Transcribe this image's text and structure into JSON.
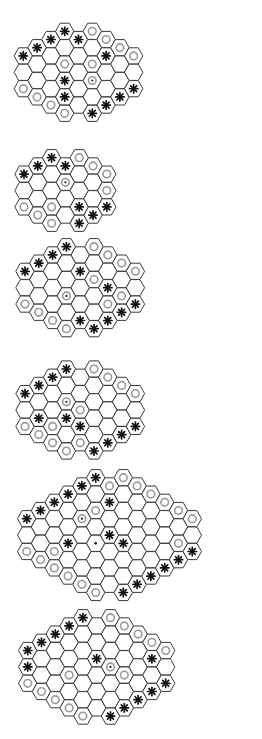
{
  "figure": {
    "colors": {
      "cell_fill": "#ffffff",
      "cell_stroke": "#3a3a3a",
      "ring": "#9a9a9a",
      "star": "#111111",
      "dot": "#222222"
    },
    "legend_piece_types": [
      "star",
      "ring",
      "ring-dot",
      "dot"
    ]
  },
  "grid": {
    "col_pitch": 13.8,
    "half_row": 8.2,
    "hex_w": 18.4,
    "hex_h": 16.2
  },
  "boards": [
    {
      "name": "board-1",
      "ox": 23.3,
      "oy": 31.3,
      "col_min": [
        3,
        2,
        1,
        0,
        1,
        0,
        1,
        2,
        3
      ],
      "col_max": [
        7,
        8,
        9,
        10,
        9,
        10,
        9,
        8,
        7
      ],
      "pieces": [
        [
          3,
          0,
          "star"
        ],
        [
          5,
          0,
          "ring"
        ],
        [
          2,
          1,
          "star"
        ],
        [
          4,
          1,
          "star"
        ],
        [
          6,
          1,
          "ring"
        ],
        [
          1,
          2,
          "star"
        ],
        [
          7,
          2,
          "ring"
        ],
        [
          0,
          3,
          "star"
        ],
        [
          6,
          3,
          "star"
        ],
        [
          8,
          3,
          "ring"
        ],
        [
          3,
          4,
          "ring"
        ],
        [
          5,
          4,
          "ring"
        ],
        [
          3,
          6,
          "star"
        ],
        [
          5,
          6,
          "ring-dot"
        ],
        [
          0,
          7,
          "ring"
        ],
        [
          8,
          7,
          "star"
        ],
        [
          1,
          8,
          "ring"
        ],
        [
          3,
          8,
          "star"
        ],
        [
          7,
          8,
          "star"
        ],
        [
          2,
          9,
          "ring"
        ],
        [
          6,
          9,
          "star"
        ],
        [
          3,
          10,
          "ring"
        ],
        [
          5,
          10,
          "star"
        ]
      ]
    },
    {
      "name": "board-2",
      "ox": 24,
      "oy": 157.7,
      "col_min": [
        2,
        1,
        0,
        1,
        0,
        1,
        2
      ],
      "col_max": [
        6,
        7,
        8,
        7,
        8,
        7,
        6
      ],
      "pieces": [
        [
          2,
          0,
          "star"
        ],
        [
          4,
          0,
          "ring"
        ],
        [
          1,
          1,
          "star"
        ],
        [
          3,
          1,
          "star"
        ],
        [
          5,
          1,
          "ring"
        ],
        [
          0,
          2,
          "star"
        ],
        [
          6,
          2,
          "ring"
        ],
        [
          3,
          3,
          "ring-dot"
        ],
        [
          6,
          4,
          "ring"
        ],
        [
          0,
          6,
          "ring"
        ],
        [
          2,
          6,
          "ring"
        ],
        [
          4,
          6,
          "star"
        ],
        [
          6,
          6,
          "star"
        ],
        [
          1,
          7,
          "ring"
        ],
        [
          5,
          7,
          "star"
        ],
        [
          2,
          8,
          "ring"
        ],
        [
          4,
          8,
          "star"
        ]
      ]
    },
    {
      "name": "board-3",
      "ox": 25,
      "oy": 246.7,
      "col_min": [
        3,
        2,
        1,
        0,
        1,
        0,
        1,
        2,
        3
      ],
      "col_max": [
        7,
        8,
        9,
        10,
        9,
        10,
        9,
        8,
        7
      ],
      "pieces": [
        [
          3,
          0,
          "star"
        ],
        [
          5,
          0,
          "ring"
        ],
        [
          2,
          1,
          "star"
        ],
        [
          6,
          1,
          "ring"
        ],
        [
          1,
          2,
          "star"
        ],
        [
          7,
          2,
          "ring"
        ],
        [
          0,
          3,
          "star"
        ],
        [
          4,
          3,
          "star"
        ],
        [
          8,
          3,
          "ring"
        ],
        [
          5,
          4,
          "ring"
        ],
        [
          6,
          5,
          "star"
        ],
        [
          7,
          6,
          "ring"
        ],
        [
          3,
          6,
          "ring-dot"
        ],
        [
          0,
          7,
          "ring"
        ],
        [
          6,
          7,
          "ring"
        ],
        [
          8,
          7,
          "star"
        ],
        [
          1,
          8,
          "ring"
        ],
        [
          7,
          8,
          "star"
        ],
        [
          2,
          9,
          "ring"
        ],
        [
          4,
          9,
          "star"
        ],
        [
          6,
          9,
          "star"
        ],
        [
          3,
          10,
          "ring"
        ],
        [
          5,
          10,
          "star"
        ]
      ]
    },
    {
      "name": "board-4",
      "ox": 25,
      "oy": 369,
      "col_min": [
        3,
        2,
        1,
        0,
        1,
        0,
        1,
        2,
        3
      ],
      "col_max": [
        7,
        8,
        9,
        10,
        9,
        10,
        9,
        8,
        7
      ],
      "pieces": [
        [
          3,
          0,
          "star"
        ],
        [
          5,
          0,
          "ring"
        ],
        [
          2,
          1,
          "star"
        ],
        [
          6,
          1,
          "ring"
        ],
        [
          1,
          2,
          "star"
        ],
        [
          7,
          2,
          "ring"
        ],
        [
          0,
          3,
          "star"
        ],
        [
          8,
          3,
          "ring"
        ],
        [
          3,
          4,
          "ring-dot"
        ],
        [
          4,
          5,
          "ring"
        ],
        [
          1,
          6,
          "star"
        ],
        [
          3,
          6,
          "star"
        ],
        [
          0,
          7,
          "ring"
        ],
        [
          2,
          7,
          "ring"
        ],
        [
          4,
          7,
          "star"
        ],
        [
          8,
          7,
          "star"
        ],
        [
          1,
          8,
          "ring"
        ],
        [
          7,
          8,
          "star"
        ],
        [
          2,
          9,
          "ring"
        ],
        [
          4,
          9,
          "ring"
        ],
        [
          6,
          9,
          "star"
        ],
        [
          3,
          10,
          "ring"
        ],
        [
          5,
          10,
          "star"
        ]
      ]
    },
    {
      "name": "board-5",
      "ox": 26.7,
      "oy": 477.7,
      "col_min": [
        5,
        4,
        3,
        2,
        1,
        0,
        1,
        0,
        1,
        2,
        3,
        4,
        5
      ],
      "col_max": [
        9,
        10,
        11,
        12,
        13,
        14,
        13,
        14,
        13,
        12,
        11,
        10,
        9
      ],
      "pieces": [
        [
          5,
          0,
          "star"
        ],
        [
          7,
          0,
          "ring"
        ],
        [
          4,
          1,
          "star"
        ],
        [
          6,
          1,
          "ring"
        ],
        [
          8,
          1,
          "ring"
        ],
        [
          3,
          2,
          "star"
        ],
        [
          9,
          2,
          "ring"
        ],
        [
          2,
          3,
          "star"
        ],
        [
          6,
          3,
          "star"
        ],
        [
          10,
          3,
          "ring"
        ],
        [
          1,
          4,
          "star"
        ],
        [
          5,
          4,
          "ring"
        ],
        [
          11,
          4,
          "ring"
        ],
        [
          0,
          5,
          "star"
        ],
        [
          4,
          5,
          "ring-dot"
        ],
        [
          12,
          5,
          "ring"
        ],
        [
          6,
          7,
          "star"
        ],
        [
          3,
          8,
          "star"
        ],
        [
          5,
          8,
          "dot"
        ],
        [
          7,
          8,
          "star"
        ],
        [
          11,
          8,
          "ring"
        ],
        [
          0,
          9,
          "ring"
        ],
        [
          2,
          9,
          "ring"
        ],
        [
          12,
          9,
          "star"
        ],
        [
          1,
          10,
          "ring"
        ],
        [
          11,
          10,
          "star"
        ],
        [
          2,
          11,
          "ring"
        ],
        [
          10,
          11,
          "star"
        ],
        [
          3,
          12,
          "ring"
        ],
        [
          9,
          12,
          "star"
        ],
        [
          4,
          13,
          "ring"
        ],
        [
          8,
          13,
          "star"
        ],
        [
          5,
          14,
          "ring"
        ],
        [
          7,
          14,
          "star"
        ]
      ]
    },
    {
      "name": "board-6",
      "ox": 27.7,
      "oy": 617.7,
      "col_min": [
        4,
        3,
        2,
        1,
        0,
        1,
        0,
        1,
        2,
        3,
        4
      ],
      "col_max": [
        8,
        9,
        10,
        11,
        12,
        11,
        12,
        11,
        10,
        9,
        8
      ],
      "pieces": [
        [
          4,
          0,
          "star"
        ],
        [
          6,
          0,
          "ring"
        ],
        [
          3,
          1,
          "star"
        ],
        [
          7,
          1,
          "ring"
        ],
        [
          2,
          2,
          "star"
        ],
        [
          8,
          2,
          "ring"
        ],
        [
          1,
          3,
          "star"
        ],
        [
          9,
          3,
          "ring"
        ],
        [
          0,
          4,
          "star"
        ],
        [
          10,
          4,
          "ring"
        ],
        [
          5,
          5,
          "star"
        ],
        [
          9,
          5,
          "star"
        ],
        [
          0,
          6,
          "star"
        ],
        [
          6,
          6,
          "ring-dot"
        ],
        [
          3,
          7,
          "ring"
        ],
        [
          7,
          7,
          "ring"
        ],
        [
          0,
          8,
          "ring"
        ],
        [
          10,
          8,
          "star"
        ],
        [
          1,
          9,
          "ring"
        ],
        [
          9,
          9,
          "star"
        ],
        [
          2,
          10,
          "ring"
        ],
        [
          8,
          10,
          "star"
        ],
        [
          3,
          11,
          "ring"
        ],
        [
          7,
          11,
          "star"
        ],
        [
          4,
          12,
          "ring"
        ],
        [
          6,
          12,
          "star"
        ]
      ]
    }
  ]
}
